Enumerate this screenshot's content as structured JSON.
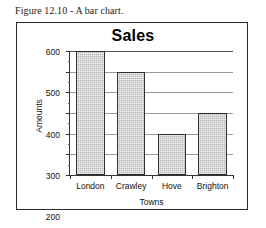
{
  "figure": {
    "caption": "Figure 12.10 - A bar chart."
  },
  "chart_data": {
    "type": "bar",
    "title": "Sales",
    "xlabel": "Towns",
    "ylabel": "Amounts",
    "categories": [
      "London",
      "Crawley",
      "Hove",
      "Brighton"
    ],
    "values": [
      600,
      500,
      200,
      300
    ],
    "ylim": [
      0,
      600
    ],
    "ytick_labels": [
      "600",
      "500",
      "400",
      "300",
      "200",
      "100",
      "0"
    ],
    "ytick_values": [
      600,
      500,
      400,
      300,
      200,
      100,
      0
    ],
    "ytick_step": 100,
    "yminor_step": 50,
    "grid": "horizontal",
    "legend": "none",
    "bar_fill_color": "#b5b5b5",
    "bar_border_color": "#2e2e2e",
    "axis_color": "#333333",
    "gridline_color": "#9a9a9a",
    "frame_color": "#2b2b2b"
  }
}
